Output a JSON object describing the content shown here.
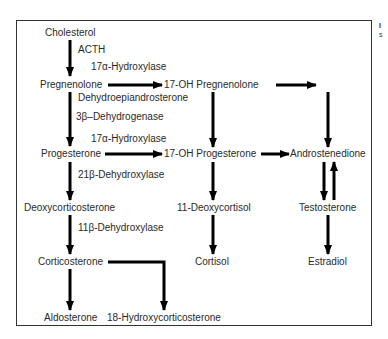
{
  "diagram": {
    "compounds": {
      "cholesterol": "Cholesterol",
      "pregnenolone": "Pregnenolone",
      "oh17_pregnenolone": "17-OH Pregnenolone",
      "progesterone": "Progesterone",
      "oh17_progesterone": "17-OH Progesterone",
      "androstenedione": "Androstenedione",
      "deoxycorticosterone": "Deoxycorticosterone",
      "deoxycortisol11": "11-Deoxycortisol",
      "testosterone": "Testosterone",
      "corticosterone": "Corticosterone",
      "cortisol": "Cortisol",
      "estradiol": "Estradiol",
      "aldosterone": "Aldosterone",
      "hydroxycorticosterone18": "18-Hydroxycorticosterone"
    },
    "enzymes": {
      "acth": "ACTH",
      "hydroxylase17a_top": "17α-Hydroxylase",
      "dhea": "Dehydroepiandrosterone",
      "dehydrogenase3b": "3β–Dehydrogenase",
      "hydroxylase17a_mid": "17α-Hydroxylase",
      "dehydroxylase21b": "21β-Dehydroxylase",
      "dehydroxylase11b": "11β-Dehydroxylase"
    },
    "side_text": {
      "line1": "I",
      "line2": "s"
    },
    "colors": {
      "arrow": "#000000",
      "border": "#333333",
      "text": "#2a2a2a"
    }
  }
}
